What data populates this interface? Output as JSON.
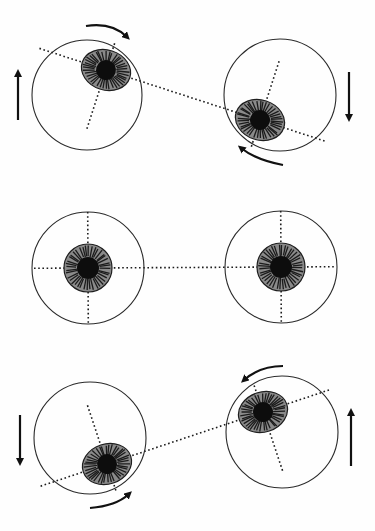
{
  "figure": {
    "title": "",
    "rows": [
      {
        "id": "top",
        "state": "rotated",
        "eyes": [
          {
            "side": "left",
            "torsion_deg": 20,
            "torsion_direction": "clockwise",
            "vertical_movement": "up"
          },
          {
            "side": "right",
            "torsion_deg": 20,
            "torsion_direction": "clockwise",
            "vertical_movement": "down"
          }
        ]
      },
      {
        "id": "middle",
        "state": "primary-position",
        "eyes": [
          {
            "side": "left",
            "torsion_deg": 0,
            "torsion_direction": "none",
            "vertical_movement": "none"
          },
          {
            "side": "right",
            "torsion_deg": 0,
            "torsion_direction": "none",
            "vertical_movement": "none"
          }
        ]
      },
      {
        "id": "bottom",
        "state": "rotated",
        "eyes": [
          {
            "side": "left",
            "torsion_deg": -20,
            "torsion_direction": "counterclockwise",
            "vertical_movement": "down"
          },
          {
            "side": "right",
            "torsion_deg": -20,
            "torsion_direction": "counterclockwise",
            "vertical_movement": "up"
          }
        ]
      }
    ],
    "colors": {
      "ink": "#111111",
      "iris": "#8a8a8a",
      "background": "#fefefe"
    }
  }
}
